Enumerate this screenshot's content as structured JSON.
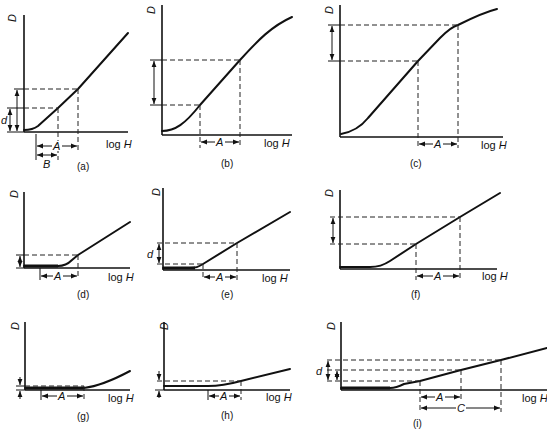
{
  "figure": {
    "y_axis_label": "D",
    "x_axis_label": "log H",
    "x_axis_label_var": "H",
    "x_axis_label_prefix": "log",
    "panels": [
      {
        "id": "a",
        "caption": "(a)",
        "intervals": [
          "A",
          "B"
        ],
        "density_label": "d"
      },
      {
        "id": "b",
        "caption": "(b)",
        "intervals": [
          "A"
        ]
      },
      {
        "id": "c",
        "caption": "(c)",
        "intervals": [
          "A"
        ]
      },
      {
        "id": "d",
        "caption": "(d)",
        "intervals": [
          "A"
        ]
      },
      {
        "id": "e",
        "caption": "(e)",
        "intervals": [
          "A"
        ],
        "density_label": "d"
      },
      {
        "id": "f",
        "caption": "(f)",
        "intervals": [
          "A"
        ]
      },
      {
        "id": "g",
        "caption": "(g)",
        "intervals": [
          "A"
        ]
      },
      {
        "id": "h",
        "caption": "(h)",
        "intervals": [
          "A"
        ]
      },
      {
        "id": "i",
        "caption": "(i)",
        "intervals": [
          "A",
          "C"
        ],
        "density_label": "d"
      }
    ]
  },
  "labels": {
    "D": "D",
    "log": "log",
    "H": "H",
    "A": "A",
    "B": "B",
    "C": "C",
    "d": "d"
  },
  "captions": {
    "a": "(a)",
    "b": "(b)",
    "c": "(c)",
    "d": "(d)",
    "e": "(e)",
    "f": "(f)",
    "g": "(g)",
    "h": "(h)",
    "i": "(i)"
  }
}
